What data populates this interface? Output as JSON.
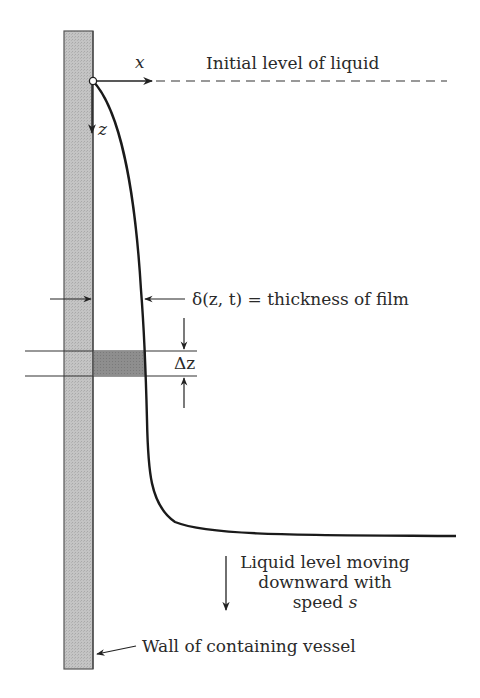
{
  "diagram": {
    "type": "physics-schematic",
    "labels": {
      "x_axis": "x",
      "z_axis": "z",
      "initial_level": "Initial level of liquid",
      "film_thickness_symbol": "δ(z, t)",
      "film_thickness_text": " = thickness of film",
      "delta_z": "Δz",
      "liquid_level_line1": "Liquid level moving",
      "liquid_level_line2": "downward with",
      "liquid_level_line3_prefix": "speed ",
      "liquid_level_line3_var": "s",
      "wall": "Wall of containing vessel"
    },
    "colors": {
      "wall_fill": "#c4c4c4",
      "wall_stroke": "#555555",
      "element_fill": "#8e8e8e",
      "line": "#222222",
      "text": "#2a2a2a",
      "background": "#ffffff"
    }
  }
}
